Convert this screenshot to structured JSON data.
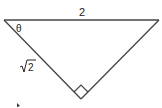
{
  "diagram": {
    "type": "right-triangle",
    "labels": {
      "hypotenuse": "2",
      "angle": "θ",
      "leg": "√2",
      "leg_radicand": "2"
    },
    "right_angle_marker": true,
    "colors": {
      "stroke": "#444444",
      "text": "#222222"
    }
  }
}
